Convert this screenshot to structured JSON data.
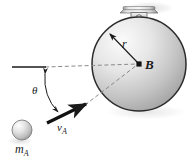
{
  "figure": {
    "kind": "mechanics-impact-diagram",
    "background_color": "#ffffff",
    "labels": {
      "center_point": "B",
      "radius": "r",
      "angle": "θ",
      "velocity": "v",
      "velocity_sub": "A",
      "mass": "m",
      "mass_sub": "A"
    },
    "colors": {
      "line": "#1a1a1a",
      "dash": "#7a7a7a",
      "disk_light": "#f2f2f2",
      "disk_mid": "#c9c9c9",
      "disk_dark": "#9a9a9a",
      "ball_light": "#fdfdfd",
      "ball_mid": "#d8d8d8",
      "ball_dark": "#a0a0a0",
      "pivot_light": "#efefef",
      "pivot_mid": "#bdbdbd",
      "pivot_dark": "#8c8c8c",
      "shadow": "#d9d9d9"
    },
    "geometry": {
      "disk_center_x": 139,
      "disk_center_y": 64,
      "disk_radius": 47,
      "ball_center_x": 22,
      "ball_center_y": 130,
      "ball_radius": 10,
      "pivot_x": 139,
      "pivot_y": 11,
      "horizontal_line_y": 67,
      "horizontal_line_x1": 12,
      "horizontal_line_x2": 45,
      "velocity_arrow_x1": 48,
      "velocity_arrow_y1": 122,
      "velocity_arrow_x2": 87,
      "velocity_arrow_y2": 104,
      "angle_vertex_x": 45,
      "angle_vertex_y": 67,
      "angle_degrees": 25
    },
    "elements": [
      "pivot-bracket",
      "disk-body",
      "radius-arrow",
      "center-dot",
      "horizontal-reference-line",
      "horizontal-dashed-line",
      "trajectory-dashed-line",
      "angle-arc",
      "velocity-arrow",
      "mass-ball",
      "ball-shadow"
    ]
  }
}
